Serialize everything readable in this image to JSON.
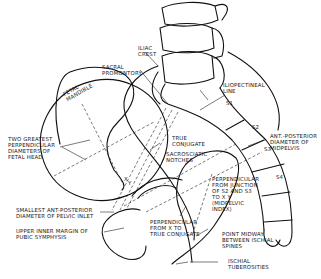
{
  "figure": {
    "type": "anatomical line diagram"
  },
  "labels": {
    "iliac_crest": "ILIAC\nCREST",
    "sacral_promontory": "SACRAL\nPROMONTORY",
    "fetal_mandible": "FETAL\nMANDIBLE",
    "iliopectineal_line": "ILIOPECTINEAL\nLINE",
    "s1": "S1",
    "s2": "S2",
    "s3": "S3",
    "s4": "S4",
    "two_greatest": "TWO GREATEST\nPERPENDICULAR\nDIAMETERS OF\nFETAL HEAD",
    "true_conjugate": "TRUE\nCONJUGATE",
    "sacrosciatic_notches": "SACROSCIATIC\nNOTCHES",
    "ant_posterior_midpelvis": "ANT.-POSTERIOR\nDIAMETER OF\nMIDPELVIS",
    "perpendicular_s2s3": "PERPENDICULAR\nFROM JUNCTION\nOF S2 and S3\nTO X Y\n(MIDPELVIC\nINDEX)",
    "smallest_ap": "SMALLEST ANT-POSTERIOR\nDIAMETER OF PELVIC INLET",
    "upper_inner_margin": "UPPER INNER MARGIN OF\nPUBIC SYMPHYSIS",
    "perpendicular_x": "PERPENDICULAR\nFROM X TO\nTRUE CONJUGATE",
    "point_midway": "POINT MIDWAY\nBETWEEN ISCHIAL\nSPINES",
    "ischial_tuberosities": "ISCHIAL\nTUBEROSITIES",
    "x_mark": "X",
    "y_mark": "Y"
  }
}
